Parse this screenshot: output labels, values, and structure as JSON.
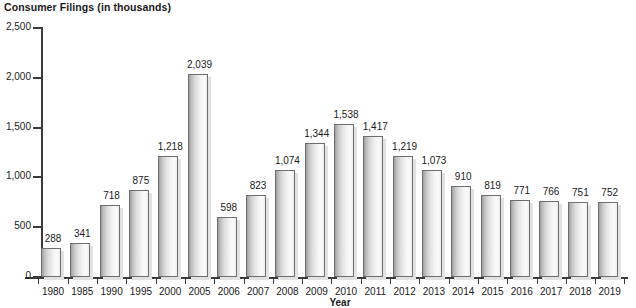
{
  "chart_data": {
    "type": "bar",
    "title": "Consumer Filings (in thousands)",
    "xlabel": "Year",
    "ylabel": "",
    "ylim": [
      0,
      2500
    ],
    "yticks": [
      "0",
      "500",
      "1,000",
      "1,500",
      "2,000",
      "2,500"
    ],
    "ytick_values": [
      0,
      500,
      1000,
      1500,
      2000,
      2500
    ],
    "grid": false,
    "legend": null,
    "categories": [
      "1980",
      "1985",
      "1990",
      "1995",
      "2000",
      "2005",
      "2006",
      "2007",
      "2008",
      "2009",
      "2010",
      "2011",
      "2012",
      "2013",
      "2014",
      "2015",
      "2016",
      "2017",
      "2018",
      "2019"
    ],
    "values": [
      288,
      341,
      718,
      875,
      1218,
      2039,
      598,
      823,
      1074,
      1344,
      1538,
      1417,
      1219,
      1073,
      910,
      819,
      771,
      766,
      751,
      752
    ],
    "value_labels": [
      "288",
      "341",
      "718",
      "875",
      "1,218",
      "2,039",
      "598",
      "823",
      "1,074",
      "1,344",
      "1,538",
      "1,417",
      "1,219",
      "1,073",
      "910",
      "819",
      "771",
      "766",
      "751",
      "752"
    ],
    "colors": {
      "bar_fill_dark": "#9e9e9e",
      "bar_fill_light": "#fbfbfb",
      "bar_border": "#6e6e6e",
      "bar_shadow": "#e2e2e2",
      "axis": "#3b3b3b",
      "text": "#1a1a1a",
      "background": "#ffffff"
    }
  }
}
